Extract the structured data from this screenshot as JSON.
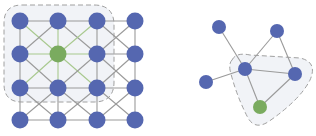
{
  "colors": {
    "node": "#5567b0",
    "highlight_node": "#7aab5f",
    "edge": "#9a9a9a",
    "highlight_edge": "#a8c98e",
    "region_fill": "#eef1f6",
    "region_border": "#a0a0a0",
    "background": "#ffffff"
  },
  "grid_graph": {
    "rows": 4,
    "cols": 4,
    "highlight_node": [
      1,
      1
    ],
    "neighborhood_region": "rows 0-2, cols 0-2",
    "edge_types": [
      "horizontal",
      "vertical",
      "diagonal"
    ]
  },
  "free_graph": {
    "nodes": [
      {
        "id": "top-left",
        "highlight": false
      },
      {
        "id": "top-right",
        "highlight": false
      },
      {
        "id": "center",
        "highlight": false
      },
      {
        "id": "right",
        "highlight": false
      },
      {
        "id": "left",
        "highlight": false
      },
      {
        "id": "bottom",
        "highlight": true
      }
    ],
    "edges": [
      [
        "top-left",
        "center"
      ],
      [
        "top-right",
        "center"
      ],
      [
        "top-right",
        "right"
      ],
      [
        "left",
        "center"
      ],
      [
        "center",
        "right"
      ],
      [
        "center",
        "bottom"
      ],
      [
        "right",
        "bottom"
      ]
    ],
    "neighborhood_nodes": [
      "center",
      "right",
      "bottom"
    ]
  }
}
